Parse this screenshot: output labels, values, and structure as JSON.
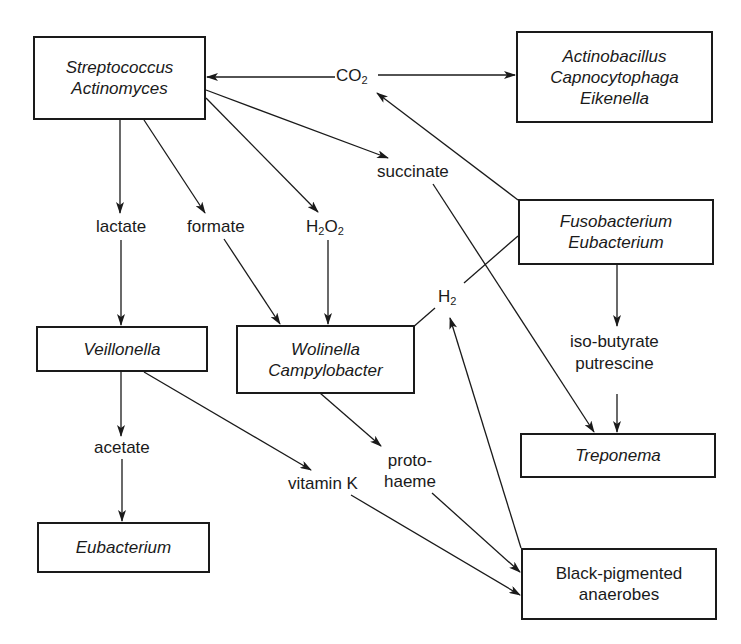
{
  "diagram": {
    "type": "metabolic-interaction-network",
    "nodes": [
      {
        "id": "strep",
        "lines": [
          "Streptococcus",
          "Actinomyces"
        ],
        "italic": true
      },
      {
        "id": "actino",
        "lines": [
          "Actinobacillus",
          "Capnocytophaga",
          "Eikenella"
        ],
        "italic": true
      },
      {
        "id": "fuso",
        "lines": [
          "Fusobacterium",
          "Eubacterium"
        ],
        "italic": true
      },
      {
        "id": "veil",
        "lines": [
          "Veillonella"
        ],
        "italic": true
      },
      {
        "id": "wolin",
        "lines": [
          "Wolinella",
          "Campylobacter"
        ],
        "italic": true
      },
      {
        "id": "trepo",
        "lines": [
          "Treponema"
        ],
        "italic": true
      },
      {
        "id": "eubac",
        "lines": [
          "Eubacterium"
        ],
        "italic": true
      },
      {
        "id": "bpa",
        "lines": [
          "Black-pigmented",
          "anaerobes"
        ],
        "italic": false
      }
    ],
    "metabolites": {
      "co2": {
        "base": "CO",
        "sub": "2"
      },
      "succinate": "succinate",
      "lactate": "lactate",
      "formate": "formate",
      "h2o2": {
        "a": "H",
        "sub1": "2",
        "b": "O",
        "sub2": "2"
      },
      "h2": {
        "base": "H",
        "sub": "2"
      },
      "isobutyrate": [
        "iso-butyrate",
        "putrescine"
      ],
      "acetate": "acetate",
      "vitamink": "vitamin K",
      "protohaeme": [
        "proto-",
        "haeme"
      ]
    },
    "edges": [
      {
        "from": "CO2",
        "to": "Streptococcus/Actinomyces"
      },
      {
        "from": "CO2",
        "to": "Actinobacillus/Capnocytophaga/Eikenella"
      },
      {
        "from": "Fusobacterium/Eubacterium",
        "to": "CO2"
      },
      {
        "from": "Streptococcus/Actinomyces",
        "to": "lactate"
      },
      {
        "from": "Streptococcus/Actinomyces",
        "to": "formate"
      },
      {
        "from": "Streptococcus/Actinomyces",
        "to": "H2O2"
      },
      {
        "from": "Streptococcus/Actinomyces",
        "to": "succinate"
      },
      {
        "from": "lactate",
        "to": "Veillonella"
      },
      {
        "from": "formate",
        "to": "Wolinella/Campylobacter"
      },
      {
        "from": "H2O2",
        "to": "Wolinella/Campylobacter"
      },
      {
        "from": "succinate",
        "to": "Treponema"
      },
      {
        "from": "Fusobacterium/Eubacterium",
        "to": "H2"
      },
      {
        "from": "H2",
        "to": "Wolinella/Campylobacter"
      },
      {
        "from": "Black-pigmented anaerobes",
        "to": "H2"
      },
      {
        "from": "Fusobacterium/Eubacterium",
        "to": "iso-butyrate/putrescine"
      },
      {
        "from": "iso-butyrate/putrescine",
        "to": "Treponema"
      },
      {
        "from": "Veillonella",
        "to": "acetate"
      },
      {
        "from": "acetate",
        "to": "Eubacterium"
      },
      {
        "from": "Veillonella",
        "to": "vitamin K"
      },
      {
        "from": "vitamin K",
        "to": "Black-pigmented anaerobes"
      },
      {
        "from": "Wolinella/Campylobacter",
        "to": "proto-haeme"
      },
      {
        "from": "proto-haeme",
        "to": "Black-pigmented anaerobes"
      }
    ],
    "colors": {
      "ink": "#1a1a1a",
      "background": "#ffffff"
    }
  }
}
